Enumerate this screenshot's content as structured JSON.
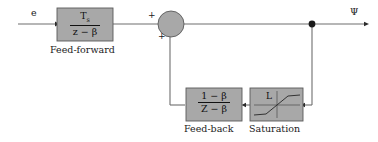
{
  "diagram": {
    "background_color": "#ffffff",
    "block_fill_color": "#a8a8a8",
    "block_border_color": "#5a5a5a",
    "wire_color": "#6e6e6e",
    "text_color": "#1a1a1a"
  },
  "signals": {
    "input_label": "e",
    "output_label": "Ψ"
  },
  "summing_junction": {
    "name": "summing-junction",
    "sign_top": "+",
    "sign_bottom": "+"
  },
  "blocks": {
    "feed_forward": {
      "caption": "Feed-forward",
      "numerator": "T",
      "numerator_subscript": "s",
      "denominator": "z − β"
    },
    "feed_back": {
      "caption": "Feed-back",
      "numerator": "1 − β",
      "denominator": "Z − β"
    },
    "saturation": {
      "caption": "Saturation",
      "limit_label": "L"
    }
  },
  "icons": {
    "junction_dot": "junction-dot-icon",
    "arrow_tip": "arrow-tip-icon",
    "saturation_curve": "saturation-curve-icon"
  }
}
